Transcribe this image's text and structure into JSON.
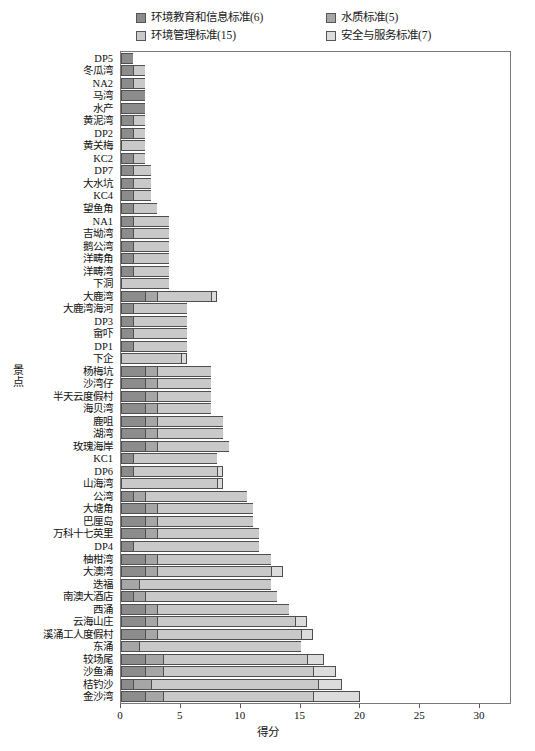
{
  "chart_data": {
    "type": "bar",
    "orientation": "horizontal",
    "stacked": true,
    "title": "",
    "xlabel": "得分",
    "ylabel": "景点",
    "xlim": [
      0,
      32.5
    ],
    "xticks": [
      0,
      5,
      10,
      15,
      20,
      25,
      30
    ],
    "grid": false,
    "legend_position": "top",
    "series": [
      {
        "name": "环境教育和信息标准(6)",
        "color": "#8c8c8c"
      },
      {
        "name": "水质标准(5)",
        "color": "#a6a6a6"
      },
      {
        "name": "环境管理标准(15)",
        "color": "#c9c9c9"
      },
      {
        "name": "安全与服务标准(7)",
        "color": "#dcdcdc"
      }
    ],
    "categories": [
      "DP5",
      "冬瓜湾",
      "NA2",
      "马湾",
      "水产",
      "黄泥湾",
      "DP2",
      "黄关梅",
      "KC2",
      "DP7",
      "大水坑",
      "KC4",
      "望鱼角",
      "NA1",
      "吉坳湾",
      "鹅公湾",
      "洋畴角",
      "洋畴湾",
      "下洞",
      "大鹿湾",
      "大鹿湾海河",
      "DP3",
      "畲吓",
      "DP1",
      "下企",
      "杨梅坑",
      "沙湾仔",
      "半天云度假村",
      "海贝湾",
      "鹿咀",
      "湖湾",
      "玫瑰海岸",
      "KC1",
      "DP6",
      "山海湾",
      "公湾",
      "大塘角",
      "巴厘岛",
      "万科十七英里",
      "DP4",
      "柚柑湾",
      "大澳湾",
      "迭福",
      "南澳大酒店",
      "西涌",
      "云海山庄",
      "溪涌工人度假村",
      "东涌",
      "较场尾",
      "沙鱼涌",
      "桔钓沙",
      "金沙湾"
    ],
    "values": [
      [
        1.0,
        0.0,
        0.0,
        0.0
      ],
      [
        1.0,
        0.0,
        1.0,
        0.0
      ],
      [
        1.0,
        0.0,
        1.0,
        0.0
      ],
      [
        2.0,
        0.0,
        0.0,
        0.0
      ],
      [
        2.0,
        0.0,
        0.0,
        0.0
      ],
      [
        1.0,
        0.0,
        1.0,
        0.0
      ],
      [
        1.0,
        0.0,
        1.0,
        0.0
      ],
      [
        0.0,
        0.0,
        2.0,
        0.0
      ],
      [
        1.0,
        0.0,
        1.0,
        0.0
      ],
      [
        1.0,
        0.0,
        1.5,
        0.0
      ],
      [
        1.0,
        0.0,
        1.5,
        0.0
      ],
      [
        1.0,
        0.0,
        1.5,
        0.0
      ],
      [
        1.0,
        0.0,
        2.0,
        0.0
      ],
      [
        1.0,
        0.0,
        3.0,
        0.0
      ],
      [
        1.0,
        0.0,
        3.0,
        0.0
      ],
      [
        1.0,
        0.0,
        3.0,
        0.0
      ],
      [
        1.0,
        0.0,
        3.0,
        0.0
      ],
      [
        1.0,
        0.0,
        3.0,
        0.0
      ],
      [
        0.0,
        0.0,
        4.0,
        0.0
      ],
      [
        2.0,
        1.0,
        4.5,
        0.5
      ],
      [
        1.0,
        0.0,
        4.5,
        0.0
      ],
      [
        1.0,
        0.0,
        4.5,
        0.0
      ],
      [
        1.0,
        0.0,
        4.5,
        0.0
      ],
      [
        1.0,
        0.0,
        4.5,
        0.0
      ],
      [
        0.0,
        0.0,
        5.0,
        0.5
      ],
      [
        2.0,
        1.0,
        4.5,
        0.0
      ],
      [
        2.0,
        1.0,
        4.5,
        0.0
      ],
      [
        2.0,
        1.0,
        4.5,
        0.0
      ],
      [
        2.0,
        1.0,
        4.5,
        0.0
      ],
      [
        2.0,
        1.0,
        5.5,
        0.0
      ],
      [
        2.0,
        1.0,
        5.5,
        0.0
      ],
      [
        2.0,
        1.0,
        6.0,
        0.0
      ],
      [
        1.0,
        0.0,
        7.0,
        0.0
      ],
      [
        1.0,
        0.0,
        7.0,
        0.5
      ],
      [
        0.0,
        0.0,
        8.0,
        0.5
      ],
      [
        1.0,
        1.0,
        8.5,
        0.0
      ],
      [
        2.0,
        1.0,
        8.0,
        0.0
      ],
      [
        2.0,
        1.0,
        8.0,
        0.0
      ],
      [
        2.0,
        1.0,
        8.5,
        0.0
      ],
      [
        1.0,
        0.0,
        10.5,
        0.0
      ],
      [
        2.0,
        1.0,
        9.5,
        0.0
      ],
      [
        2.0,
        1.0,
        9.5,
        1.0
      ],
      [
        0.0,
        1.5,
        11.0,
        0.0
      ],
      [
        1.0,
        1.0,
        11.0,
        0.0
      ],
      [
        2.0,
        1.0,
        11.0,
        0.0
      ],
      [
        2.0,
        1.0,
        11.5,
        1.0
      ],
      [
        2.0,
        1.0,
        12.0,
        1.0
      ],
      [
        0.0,
        1.5,
        13.5,
        0.0
      ],
      [
        2.0,
        1.5,
        12.0,
        1.5
      ],
      [
        2.0,
        1.5,
        12.5,
        2.0
      ],
      [
        1.0,
        1.5,
        14.0,
        2.0
      ],
      [
        2.0,
        1.5,
        12.5,
        4.0
      ]
    ]
  }
}
